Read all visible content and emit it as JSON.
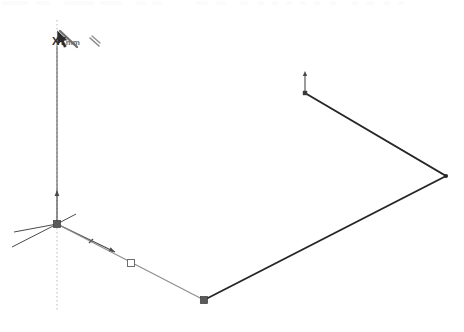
{
  "app": {
    "name": "3D CAD Sketch Viewport",
    "background_color": "#ffffff"
  },
  "toolbar": {
    "visible_strip_label": "",
    "chips": [
      {
        "x": 2,
        "w": 26
      },
      {
        "x": 36,
        "w": 14
      },
      {
        "x": 64,
        "w": 30
      },
      {
        "x": 100,
        "w": 22
      },
      {
        "x": 136,
        "w": 10
      },
      {
        "x": 152,
        "w": 10
      },
      {
        "x": 196,
        "w": 12
      },
      {
        "x": 216,
        "w": 10
      },
      {
        "x": 240,
        "w": 8
      },
      {
        "x": 258,
        "w": 6
      },
      {
        "x": 272,
        "w": 6
      },
      {
        "x": 286,
        "w": 6
      },
      {
        "x": 300,
        "w": 6
      },
      {
        "x": 314,
        "w": 6
      },
      {
        "x": 330,
        "w": 6
      },
      {
        "x": 352,
        "w": 6
      },
      {
        "x": 366,
        "w": 8
      },
      {
        "x": 384,
        "w": 6
      },
      {
        "x": 398,
        "w": 6
      }
    ]
  },
  "cursor": {
    "label": "XY",
    "unit_label": "mm",
    "icon": "arrow-pencil-cursor",
    "x": 57,
    "y": 30
  },
  "colors": {
    "axis": "#4a4a4a",
    "construction_line": "#9a9a9a",
    "dotted_guide": "#b8b8c4",
    "geometry": "#262626",
    "faint_edge": "#8d8d8d",
    "marker_fill": "#5a5a5a",
    "marker_hollow_stroke": "#6e6e6e"
  },
  "scene": {
    "origin": {
      "name": "origin-marker",
      "x": 57,
      "y": 224
    },
    "axes": [
      {
        "name": "axis-z-up",
        "x1": 57,
        "y1": 224,
        "x2": 57,
        "y2": 190,
        "arrow": true
      },
      {
        "name": "axis-z-stem",
        "x1": 57,
        "y1": 190,
        "x2": 57,
        "y2": 44,
        "arrow": false
      },
      {
        "name": "axis-x-right",
        "x1": 57,
        "y1": 224,
        "x2": 115,
        "y2": 252,
        "arrow": true
      },
      {
        "name": "axis-y-left",
        "x1": 57,
        "y1": 224,
        "x2": 12,
        "y2": 247,
        "arrow": false
      },
      {
        "name": "axis-aux-left",
        "x1": 57,
        "y1": 224,
        "x2": 14,
        "y2": 232,
        "arrow": false
      },
      {
        "name": "axis-aux-right",
        "x1": 57,
        "y1": 224,
        "x2": 76,
        "y2": 214,
        "arrow": false
      }
    ],
    "dotted_guide": {
      "name": "vertical-dotted-guide",
      "x": 57,
      "y1": 20,
      "y2": 312
    },
    "construction_edge": {
      "name": "construction-edge",
      "x1": 57,
      "y1": 224,
      "x2": 204,
      "y2": 300
    },
    "geometry_path": {
      "name": "sketch-polyline",
      "points": [
        {
          "x": 305,
          "y": 93
        },
        {
          "x": 446,
          "y": 176
        },
        {
          "x": 204,
          "y": 300
        }
      ]
    },
    "markers": [
      {
        "name": "vertex-origin-square",
        "type": "filled-square",
        "x": 57,
        "y": 224,
        "size": 7
      },
      {
        "name": "snap-tick-small",
        "type": "tick",
        "x": 91,
        "y": 241,
        "size": 4
      },
      {
        "name": "snap-midpoint-square",
        "type": "hollow-square",
        "x": 131,
        "y": 263,
        "size": 7
      },
      {
        "name": "vertex-lower-square",
        "type": "filled-square",
        "x": 204,
        "y": 300,
        "size": 7
      },
      {
        "name": "vertex-right-dot",
        "type": "filled-dot",
        "x": 446,
        "y": 176,
        "size": 4
      },
      {
        "name": "endpoint-normal-arrow",
        "type": "up-arrow",
        "x": 305,
        "y": 93,
        "size": 22
      }
    ]
  }
}
